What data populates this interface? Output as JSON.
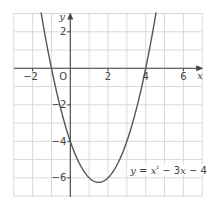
{
  "chart_data": {
    "type": "line",
    "title": "",
    "xlabel": "x",
    "ylabel": "y",
    "origin_label": "O",
    "xlim": [
      -3,
      7
    ],
    "ylim": [
      -7,
      3
    ],
    "grid": true,
    "grid_step": 1,
    "x_tick_labels": [
      {
        "value": -2,
        "text": "−2"
      },
      {
        "value": 2,
        "text": "2"
      },
      {
        "value": 4,
        "text": "4"
      },
      {
        "value": 6,
        "text": "6"
      }
    ],
    "y_tick_labels": [
      {
        "value": 2,
        "text": "2"
      },
      {
        "value": -2,
        "text": "−2"
      },
      {
        "value": -4,
        "text": "−4"
      },
      {
        "value": -6,
        "text": "−6"
      }
    ],
    "series": [
      {
        "name": "y = x² − 3x − 4",
        "function": "x^2 - 3x - 4",
        "coefficients": {
          "a": 1,
          "b": -3,
          "c": -4
        },
        "x_intercepts": [
          -1,
          4
        ],
        "y_intercept": -4,
        "vertex": [
          1.5,
          -6.25
        ],
        "x": [
          -1.6,
          -1,
          0,
          1,
          1.5,
          2,
          3,
          4,
          4.6
        ],
        "y": [
          3.36,
          0,
          -4,
          -6,
          -6.25,
          -6,
          -4,
          0,
          3.36
        ]
      }
    ],
    "annotations": [
      {
        "text_parts": [
          "y",
          " = ",
          "x",
          "²",
          " − 3",
          "x",
          " − 4"
        ],
        "position": [
          3.5,
          -5.6
        ]
      }
    ]
  },
  "style": {
    "curve_color": "#555555",
    "axis_color": "#444444",
    "grid_color": "#d9d9d9",
    "label_color": "#444444"
  }
}
